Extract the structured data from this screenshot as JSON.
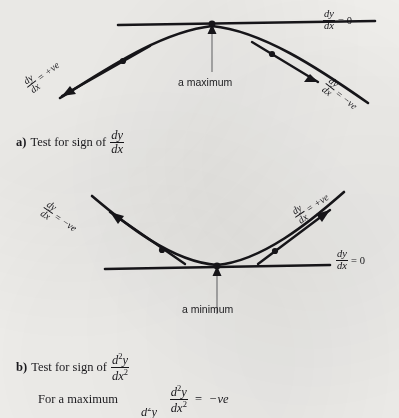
{
  "page": {
    "background_color": "#f2f1ee",
    "ink_color": "#17161a"
  },
  "math": {
    "dy": "dy",
    "dx": "dx",
    "d2y": "d",
    "d2y_sup": "2",
    "d2y_var": "y",
    "dx2": "dx",
    "dx2_sup": "2",
    "equals": "=",
    "zero": "0",
    "plus_ve": "+ve",
    "minus_ve": "−ve"
  },
  "figure_max": {
    "name": "maximum-curve-figure",
    "axis_label": {
      "equals": "=",
      "value": "0"
    },
    "left_tag": {
      "equals": "=",
      "value": "+ve",
      "rotation_deg": -38
    },
    "right_tag": {
      "equals": "=",
      "value": "−ve",
      "rotation_deg": 38
    },
    "pointer_caption": "a maximum"
  },
  "figure_min": {
    "name": "minimum-curve-figure",
    "axis_label": {
      "equals": "=",
      "value": "0"
    },
    "left_tag": {
      "equals": "=",
      "value": "−ve",
      "rotation_deg": 34
    },
    "right_tag": {
      "equals": "=",
      "value": "+ve",
      "rotation_deg": -34
    },
    "pointer_caption": "a minimum"
  },
  "captions": {
    "a": {
      "lead": "a)",
      "text": "Test for sign of",
      "numerator": "dy",
      "denominator": "dx"
    },
    "b": {
      "lead": "b)",
      "text": "Test for sign of",
      "numerator_base": "d",
      "numerator_sup": "2",
      "numerator_var": "y",
      "denominator_base": "dx",
      "denominator_sup": "2"
    },
    "for_maximum": {
      "text": "For a maximum",
      "numerator_base": "d",
      "numerator_sup": "2",
      "numerator_var": "y",
      "denominator_base": "dx",
      "denominator_sup": "2",
      "equals": "=",
      "value": "−ve"
    },
    "cut_off_line": {
      "numerator_base": "d",
      "numerator_sup": "2",
      "numerator_var": "y"
    }
  }
}
